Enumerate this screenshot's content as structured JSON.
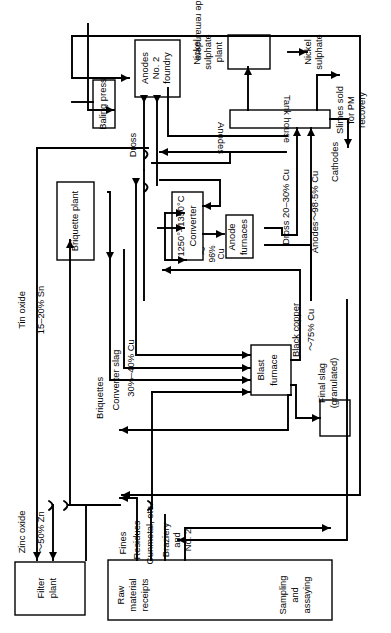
{
  "diagram": {
    "orientation": "rotated-90",
    "stroke_color": "#000000",
    "background_color": "#ffffff",
    "boxes": [
      {
        "id": "anodes_no2_foundry",
        "label": "Anodes\nNo. 2\nfoundry",
        "line1": "Anodes",
        "line2": "No. 2",
        "line3": "foundry"
      },
      {
        "id": "baling_press",
        "label": "Baling press"
      },
      {
        "id": "nickel_sulphate_plant_box",
        "label": ""
      },
      {
        "id": "tank_house",
        "label": "Tank house"
      },
      {
        "id": "briquette_plant",
        "label": "Briquette plant"
      },
      {
        "id": "converter",
        "label": "1250°–1350°C\nConverter",
        "line1": "1250°–1350°C",
        "line2": "Converter"
      },
      {
        "id": "anode_furnaces",
        "label": "Anode\nfurnaces",
        "line1": "Anode",
        "line2": "furnaces"
      },
      {
        "id": "blast_furnace",
        "label": "Blast\nfurnace",
        "line1": "Blast",
        "line2": "furnace"
      },
      {
        "id": "final_slag_box",
        "label": ""
      },
      {
        "id": "filter_plant",
        "label": "Filter\nplant",
        "line1": "Filter",
        "line2": "plant"
      },
      {
        "id": "raw_material_sampling",
        "line1": "Raw",
        "line2": "material",
        "line3": "receipts",
        "line4": "Sampling",
        "line5": "and",
        "line6": "assaying"
      }
    ],
    "flow_labels": {
      "anode_remainders": "Anode remainders",
      "nickel_sulphate_plant": "Nickel\nsulphate\nplant",
      "nickel_sulphate_plant_l1": "Nickel",
      "nickel_sulphate_plant_l2": "sulphate",
      "nickel_sulphate_plant_l3": "plant",
      "nickel_sulphate": "Nickel\nsulphate",
      "nickel_sulphate_l1": "Nickel",
      "nickel_sulphate_l2": "sulphate",
      "slimes_sold": "Slimes sold\nfor PM\nrecovery",
      "slimes_l1": "Slimes sold",
      "slimes_l2": "for PM",
      "slimes_l3": "recovery",
      "cathodes": "Cathodes",
      "anodes": "Anodes",
      "dross": "Dross",
      "dross_20_30": "Dross 20–30% Cu",
      "anodes_985": "Anodes～98·5% Cu",
      "cu_96_tilde": "～",
      "cu_96_pct": "96%",
      "cu_96_cu": "Cu",
      "tin_oxide": "Tin oxide",
      "tin_oxide_pct": "15–20% Sn",
      "zinc_oxide": "Zinc oxide",
      "zinc_oxide_pct": "～50% Zn",
      "briquettes": "Briquettes",
      "converter_slag": "Converter   slag",
      "converter_slag_pct": "30%–40% Cu",
      "black_copper": "Black copper",
      "black_copper_pct": "～75% Cu",
      "final_slag": "Final slag\n(granulated)",
      "final_slag_l1": "Final slag",
      "final_slag_l2": "(granulated)",
      "fines": "Fines",
      "residues": "Residues",
      "gunmetal": "Gunmetal, etc.",
      "braziery": "Braziery\nand\nNo. 2",
      "braziery_l1": "Braziery",
      "braziery_l2": "and",
      "braziery_l3": "No. 2"
    }
  }
}
